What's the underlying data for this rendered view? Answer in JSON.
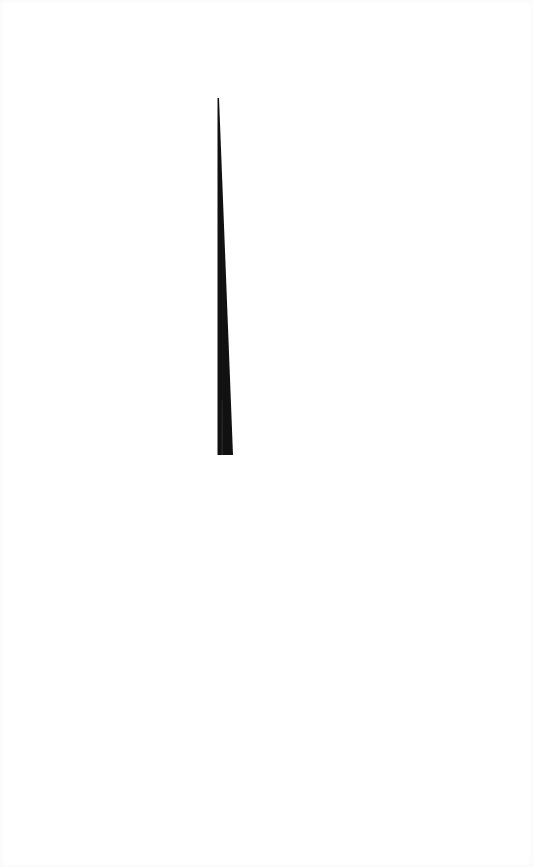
{
  "canvas": {
    "width": 533,
    "height": 867,
    "background": "#ffffff"
  },
  "shape": {
    "type": "tapered-spike",
    "color": "#111111",
    "highlight_color": "#3a3a3a",
    "apex": [
      218,
      98
    ],
    "base_left": [
      218,
      455
    ],
    "base_right": [
      233,
      455
    ]
  }
}
